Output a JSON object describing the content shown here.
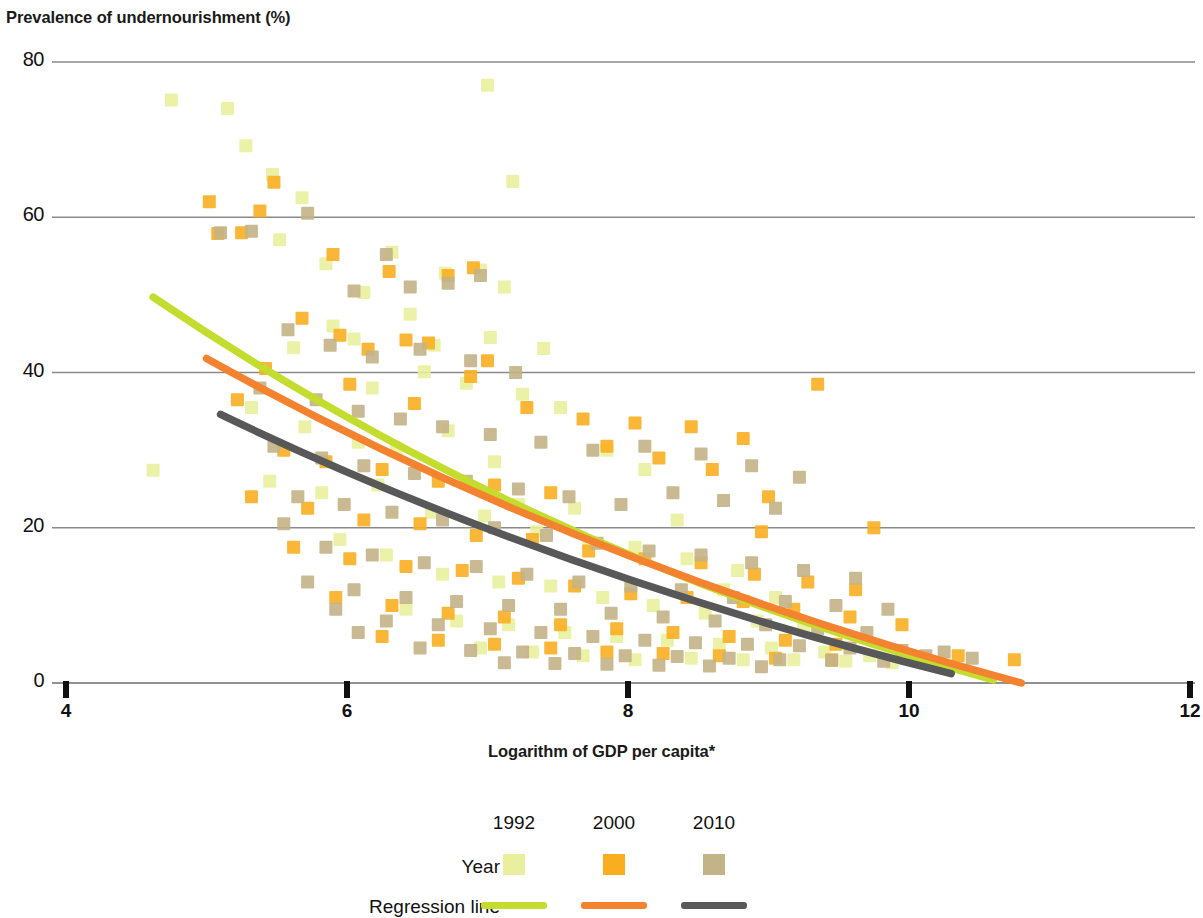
{
  "chart_data": {
    "type": "scatter",
    "title": "",
    "ylabel": "Prevalence of undernourishment (%)",
    "xlabel": "Logarithm of GDP per capita*",
    "xlim": [
      4,
      12
    ],
    "ylim": [
      0,
      80
    ],
    "xticks": [
      4,
      6,
      8,
      10,
      12
    ],
    "yticks": [
      0,
      20,
      40,
      60,
      80
    ],
    "grid": "horizontal",
    "legend_position": "bottom",
    "legend": {
      "year_headers": [
        "1992",
        "2000",
        "2010"
      ],
      "row_labels": [
        "Year",
        "Regression line"
      ],
      "marker_colors": [
        "#e9ef9c",
        "#f9ae20",
        "#c3b388"
      ],
      "line_colors": [
        "#c3dc2e",
        "#f4822f",
        "#585858"
      ]
    },
    "series": [
      {
        "name": "1992",
        "color": "#e9ef9c",
        "marker": "square",
        "points": [
          [
            4.75,
            75.1
          ],
          [
            5.15,
            74.0
          ],
          [
            5.28,
            69.2
          ],
          [
            5.47,
            65.5
          ],
          [
            5.68,
            62.5
          ],
          [
            5.52,
            57.1
          ],
          [
            5.85,
            54.0
          ],
          [
            6.12,
            50.3
          ],
          [
            7.0,
            77.0
          ],
          [
            7.18,
            64.6
          ],
          [
            7.12,
            51.0
          ],
          [
            6.95,
            53.2
          ],
          [
            6.7,
            52.8
          ],
          [
            6.32,
            55.5
          ],
          [
            6.45,
            47.5
          ],
          [
            5.9,
            46.0
          ],
          [
            5.62,
            43.2
          ],
          [
            6.05,
            44.3
          ],
          [
            6.62,
            43.5
          ],
          [
            7.02,
            44.5
          ],
          [
            7.4,
            43.1
          ],
          [
            6.18,
            38.0
          ],
          [
            6.55,
            40.1
          ],
          [
            6.85,
            38.6
          ],
          [
            7.25,
            37.2
          ],
          [
            4.62,
            27.4
          ],
          [
            5.32,
            35.5
          ],
          [
            5.7,
            33.0
          ],
          [
            6.08,
            31.0
          ],
          [
            6.35,
            30.2
          ],
          [
            6.72,
            32.5
          ],
          [
            7.05,
            28.5
          ],
          [
            7.52,
            35.5
          ],
          [
            7.85,
            30.0
          ],
          [
            8.12,
            27.5
          ],
          [
            5.45,
            26.0
          ],
          [
            5.82,
            24.5
          ],
          [
            6.22,
            25.5
          ],
          [
            6.6,
            22.0
          ],
          [
            6.98,
            21.5
          ],
          [
            7.35,
            19.5
          ],
          [
            7.72,
            18.0
          ],
          [
            8.05,
            17.5
          ],
          [
            8.42,
            16.0
          ],
          [
            8.78,
            14.5
          ],
          [
            5.95,
            18.5
          ],
          [
            6.28,
            16.5
          ],
          [
            6.68,
            14.0
          ],
          [
            7.08,
            13.0
          ],
          [
            7.45,
            12.5
          ],
          [
            7.82,
            11.0
          ],
          [
            8.18,
            10.0
          ],
          [
            8.55,
            9.0
          ],
          [
            8.92,
            8.0
          ],
          [
            9.25,
            7.0
          ],
          [
            6.42,
            9.5
          ],
          [
            6.78,
            8.0
          ],
          [
            7.15,
            7.5
          ],
          [
            7.55,
            6.5
          ],
          [
            7.92,
            6.0
          ],
          [
            8.28,
            5.5
          ],
          [
            8.65,
            5.0
          ],
          [
            9.02,
            4.5
          ],
          [
            9.4,
            4.0
          ],
          [
            9.72,
            3.5
          ],
          [
            6.95,
            4.5
          ],
          [
            7.32,
            4.0
          ],
          [
            7.68,
            3.5
          ],
          [
            8.05,
            3.0
          ],
          [
            8.45,
            3.2
          ],
          [
            8.82,
            3.0
          ],
          [
            9.18,
            3.0
          ],
          [
            9.55,
            2.8
          ],
          [
            9.88,
            2.6
          ],
          [
            10.2,
            2.5
          ],
          [
            7.22,
            23.0
          ],
          [
            7.62,
            22.5
          ],
          [
            8.35,
            21.0
          ],
          [
            8.68,
            12.0
          ],
          [
            9.05,
            11.0
          ]
        ]
      },
      {
        "name": "2000",
        "color": "#f9ae20",
        "marker": "square",
        "points": [
          [
            5.02,
            62.0
          ],
          [
            5.48,
            64.5
          ],
          [
            5.38,
            60.8
          ],
          [
            5.08,
            57.9
          ],
          [
            5.25,
            58.0
          ],
          [
            5.9,
            55.2
          ],
          [
            6.3,
            53.0
          ],
          [
            6.72,
            52.5
          ],
          [
            6.9,
            53.5
          ],
          [
            5.68,
            47.0
          ],
          [
            5.95,
            44.8
          ],
          [
            6.15,
            43.0
          ],
          [
            6.42,
            44.2
          ],
          [
            6.58,
            43.8
          ],
          [
            7.0,
            41.5
          ],
          [
            5.42,
            40.5
          ],
          [
            5.22,
            36.5
          ],
          [
            6.02,
            38.5
          ],
          [
            6.48,
            36.0
          ],
          [
            6.88,
            39.5
          ],
          [
            7.28,
            35.5
          ],
          [
            7.68,
            34.0
          ],
          [
            8.05,
            33.5
          ],
          [
            8.45,
            33.0
          ],
          [
            8.82,
            31.5
          ],
          [
            9.35,
            38.5
          ],
          [
            5.55,
            30.0
          ],
          [
            5.85,
            28.5
          ],
          [
            6.25,
            27.5
          ],
          [
            6.65,
            26.0
          ],
          [
            7.05,
            25.5
          ],
          [
            7.45,
            24.5
          ],
          [
            7.85,
            30.5
          ],
          [
            8.22,
            29.0
          ],
          [
            8.6,
            27.5
          ],
          [
            9.0,
            24.0
          ],
          [
            5.32,
            24.0
          ],
          [
            5.72,
            22.5
          ],
          [
            6.12,
            21.0
          ],
          [
            6.52,
            20.5
          ],
          [
            6.92,
            19.0
          ],
          [
            7.32,
            18.5
          ],
          [
            7.72,
            17.0
          ],
          [
            8.12,
            16.0
          ],
          [
            8.52,
            15.5
          ],
          [
            8.9,
            14.0
          ],
          [
            9.28,
            13.0
          ],
          [
            9.62,
            12.0
          ],
          [
            5.62,
            17.5
          ],
          [
            6.02,
            16.0
          ],
          [
            6.42,
            15.0
          ],
          [
            6.82,
            14.5
          ],
          [
            7.22,
            13.5
          ],
          [
            7.62,
            12.5
          ],
          [
            8.02,
            11.5
          ],
          [
            8.42,
            11.0
          ],
          [
            8.82,
            10.5
          ],
          [
            9.18,
            9.5
          ],
          [
            9.58,
            8.5
          ],
          [
            9.95,
            7.5
          ],
          [
            5.92,
            11.0
          ],
          [
            6.32,
            10.0
          ],
          [
            6.72,
            9.0
          ],
          [
            7.12,
            8.5
          ],
          [
            7.52,
            7.5
          ],
          [
            7.92,
            7.0
          ],
          [
            8.32,
            6.5
          ],
          [
            8.72,
            6.0
          ],
          [
            9.12,
            5.5
          ],
          [
            9.48,
            5.0
          ],
          [
            6.25,
            6.0
          ],
          [
            6.65,
            5.5
          ],
          [
            7.05,
            5.0
          ],
          [
            7.45,
            4.5
          ],
          [
            7.85,
            4.0
          ],
          [
            8.25,
            3.8
          ],
          [
            8.65,
            3.5
          ],
          [
            9.05,
            3.2
          ],
          [
            9.45,
            3.0
          ],
          [
            10.05,
            3.0
          ],
          [
            10.75,
            3.0
          ],
          [
            10.35,
            3.5
          ],
          [
            9.75,
            20.0
          ],
          [
            8.95,
            19.5
          ]
        ]
      },
      {
        "name": "2010",
        "color": "#c3b388",
        "marker": "square",
        "points": [
          [
            5.1,
            58.0
          ],
          [
            5.32,
            58.2
          ],
          [
            5.72,
            60.5
          ],
          [
            6.05,
            50.5
          ],
          [
            6.28,
            55.2
          ],
          [
            6.45,
            51.0
          ],
          [
            6.72,
            51.5
          ],
          [
            6.95,
            52.5
          ],
          [
            5.58,
            45.5
          ],
          [
            5.88,
            43.5
          ],
          [
            6.18,
            42.0
          ],
          [
            6.52,
            43.0
          ],
          [
            6.88,
            41.5
          ],
          [
            7.2,
            40.0
          ],
          [
            5.38,
            38.0
          ],
          [
            5.78,
            36.5
          ],
          [
            6.08,
            35.0
          ],
          [
            6.38,
            34.0
          ],
          [
            6.68,
            33.0
          ],
          [
            7.02,
            32.0
          ],
          [
            7.38,
            31.0
          ],
          [
            7.75,
            30.0
          ],
          [
            8.12,
            30.5
          ],
          [
            8.52,
            29.5
          ],
          [
            8.88,
            28.0
          ],
          [
            9.22,
            26.5
          ],
          [
            5.48,
            30.5
          ],
          [
            5.82,
            29.0
          ],
          [
            6.12,
            28.0
          ],
          [
            6.48,
            27.0
          ],
          [
            6.85,
            26.0
          ],
          [
            7.22,
            25.0
          ],
          [
            7.58,
            24.0
          ],
          [
            7.95,
            23.0
          ],
          [
            8.32,
            24.5
          ],
          [
            8.68,
            23.5
          ],
          [
            9.05,
            22.5
          ],
          [
            5.65,
            24.0
          ],
          [
            5.98,
            23.0
          ],
          [
            6.32,
            22.0
          ],
          [
            6.68,
            21.0
          ],
          [
            7.05,
            20.0
          ],
          [
            7.42,
            19.0
          ],
          [
            7.78,
            18.0
          ],
          [
            8.15,
            17.0
          ],
          [
            8.52,
            16.5
          ],
          [
            8.88,
            15.5
          ],
          [
            9.25,
            14.5
          ],
          [
            9.62,
            13.5
          ],
          [
            5.85,
            17.5
          ],
          [
            6.18,
            16.5
          ],
          [
            6.55,
            15.5
          ],
          [
            6.92,
            15.0
          ],
          [
            7.28,
            14.0
          ],
          [
            7.65,
            13.0
          ],
          [
            8.02,
            12.5
          ],
          [
            8.38,
            12.0
          ],
          [
            8.75,
            11.0
          ],
          [
            9.12,
            10.5
          ],
          [
            9.48,
            10.0
          ],
          [
            9.85,
            9.5
          ],
          [
            6.05,
            12.0
          ],
          [
            6.42,
            11.0
          ],
          [
            6.78,
            10.5
          ],
          [
            7.15,
            10.0
          ],
          [
            7.52,
            9.5
          ],
          [
            7.88,
            9.0
          ],
          [
            8.25,
            8.5
          ],
          [
            8.62,
            8.0
          ],
          [
            8.98,
            7.5
          ],
          [
            9.35,
            7.0
          ],
          [
            9.7,
            6.5
          ],
          [
            6.28,
            8.0
          ],
          [
            6.65,
            7.5
          ],
          [
            7.02,
            7.0
          ],
          [
            7.38,
            6.5
          ],
          [
            7.75,
            6.0
          ],
          [
            8.12,
            5.5
          ],
          [
            8.48,
            5.2
          ],
          [
            8.85,
            5.0
          ],
          [
            9.22,
            4.8
          ],
          [
            9.58,
            4.5
          ],
          [
            9.95,
            4.2
          ],
          [
            10.25,
            4.0
          ],
          [
            6.52,
            4.5
          ],
          [
            6.88,
            4.2
          ],
          [
            7.25,
            4.0
          ],
          [
            7.62,
            3.8
          ],
          [
            7.98,
            3.5
          ],
          [
            8.35,
            3.4
          ],
          [
            8.72,
            3.2
          ],
          [
            9.08,
            3.0
          ],
          [
            9.45,
            2.9
          ],
          [
            9.82,
            2.8
          ],
          [
            10.12,
            3.5
          ],
          [
            7.12,
            2.6
          ],
          [
            7.48,
            2.5
          ],
          [
            7.85,
            2.4
          ],
          [
            8.22,
            2.3
          ],
          [
            8.58,
            2.2
          ],
          [
            8.95,
            2.1
          ],
          [
            6.08,
            6.5
          ],
          [
            5.92,
            9.5
          ],
          [
            5.72,
            13.0
          ],
          [
            5.55,
            20.5
          ],
          [
            10.45,
            3.2
          ]
        ]
      }
    ],
    "regression_lines": [
      {
        "name": "1992",
        "color": "#c3dc2e",
        "x_start": 4.62,
        "y_start": 49.7,
        "x_end": 10.6,
        "y_end": 0.4,
        "curvature": 0.22
      },
      {
        "name": "2000",
        "color": "#f4822f",
        "x_start": 5.0,
        "y_start": 41.8,
        "x_end": 10.8,
        "y_end": 0.0,
        "curvature": 0.18
      },
      {
        "name": "2010",
        "color": "#585858",
        "x_start": 5.1,
        "y_start": 34.6,
        "x_end": 10.3,
        "y_end": 1.2,
        "curvature": 0.16
      }
    ]
  }
}
